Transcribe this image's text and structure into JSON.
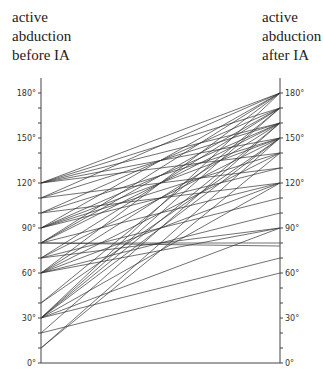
{
  "header": {
    "left": [
      "active",
      "abduction",
      "before IA"
    ],
    "right": [
      "active",
      "abduction",
      "after IA"
    ]
  },
  "chart_data": {
    "type": "line",
    "title": "",
    "xlabel": "",
    "ylabel": "active abduction (degrees)",
    "categories": [
      "active abduction before IA",
      "active abduction after IA"
    ],
    "ylim": [
      0,
      180
    ],
    "yticks_major": [
      0,
      30,
      60,
      90,
      120,
      150,
      180
    ],
    "ytick_labels": [
      "0°",
      "30°",
      "60°",
      "90°",
      "120°",
      "150°",
      "180°"
    ],
    "ytick_minor_step": 10,
    "grid": false,
    "legend": null,
    "pairs": [
      [
        120,
        180
      ],
      [
        120,
        170
      ],
      [
        120,
        160
      ],
      [
        120,
        150
      ],
      [
        120,
        140
      ],
      [
        110,
        180
      ],
      [
        110,
        160
      ],
      [
        110,
        130
      ],
      [
        100,
        170
      ],
      [
        100,
        150
      ],
      [
        100,
        120
      ],
      [
        90,
        180
      ],
      [
        90,
        160
      ],
      [
        90,
        150
      ],
      [
        90,
        140
      ],
      [
        90,
        130
      ],
      [
        80,
        180
      ],
      [
        80,
        170
      ],
      [
        80,
        160
      ],
      [
        80,
        120
      ],
      [
        80,
        80
      ],
      [
        80,
        78
      ],
      [
        70,
        170
      ],
      [
        70,
        150
      ],
      [
        70,
        110
      ],
      [
        70,
        90
      ],
      [
        60,
        180
      ],
      [
        60,
        160
      ],
      [
        60,
        140
      ],
      [
        60,
        120
      ],
      [
        60,
        100
      ],
      [
        60,
        90
      ],
      [
        40,
        170
      ],
      [
        40,
        150
      ],
      [
        30,
        180
      ],
      [
        30,
        170
      ],
      [
        30,
        160
      ],
      [
        30,
        150
      ],
      [
        30,
        120
      ],
      [
        30,
        90
      ],
      [
        30,
        70
      ],
      [
        20,
        160
      ],
      [
        20,
        60
      ],
      [
        10,
        150
      ],
      [
        10,
        140
      ]
    ]
  }
}
